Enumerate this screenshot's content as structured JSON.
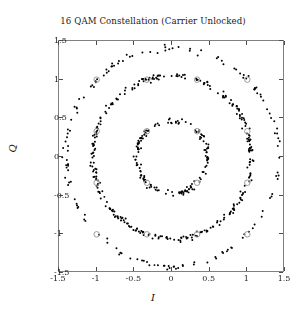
{
  "figure": {
    "title": "16 QAM Constellation (Carrier Unlocked)",
    "background": "#ffffff",
    "frame_color": "#808080"
  },
  "axes": {
    "xlabel": "I",
    "ylabel": "Q",
    "xticks": [
      "-1.5",
      "-1",
      "-0.5",
      "0",
      "0.5",
      "1",
      "1.5"
    ],
    "yticks": [
      "1.5",
      "1",
      "0.5",
      "0",
      "-0.5",
      "-1",
      "-1.5"
    ],
    "xtick_values": [
      -1.5,
      -1,
      -0.5,
      0,
      0.5,
      1,
      1.5
    ],
    "ytick_values": [
      1.5,
      1,
      0.5,
      0,
      -0.5,
      -1,
      -1.5
    ]
  },
  "chart_data": {
    "type": "scatter",
    "title": "16 QAM Constellation (Carrier Unlocked)",
    "xlabel": "I",
    "ylabel": "Q",
    "xlim": [
      -1.5,
      1.5
    ],
    "ylim": [
      -1.5,
      1.5
    ],
    "grid": false,
    "legend": null,
    "series": [
      {
        "name": "received-symbols",
        "marker": "dot",
        "color": "#000000",
        "size": 1.6,
        "description": "Received 16-QAM symbols smeared into rings by an unlocked carrier (uniform phase rotation plus AWGN).",
        "n_points": 600,
        "ring_radii": [
          0.4714,
          1.0541,
          1.4142
        ],
        "ring_counts": [
          150,
          300,
          150
        ],
        "noise_sigma": 0.018
      },
      {
        "name": "ideal-constellation",
        "marker": "open-circle",
        "color": "#9a9a9a",
        "size": 5,
        "points": [
          [
            -1.0,
            -1.0
          ],
          [
            -1.0,
            -0.3333
          ],
          [
            -1.0,
            0.3333
          ],
          [
            -1.0,
            1.0
          ],
          [
            -0.3333,
            -1.0
          ],
          [
            -0.3333,
            -0.3333
          ],
          [
            -0.3333,
            0.3333
          ],
          [
            -0.3333,
            1.0
          ],
          [
            0.3333,
            -1.0
          ],
          [
            0.3333,
            -0.3333
          ],
          [
            0.3333,
            0.3333
          ],
          [
            0.3333,
            1.0
          ],
          [
            1.0,
            -1.0
          ],
          [
            1.0,
            -0.3333
          ],
          [
            1.0,
            0.3333
          ],
          [
            1.0,
            1.0
          ]
        ]
      }
    ]
  }
}
